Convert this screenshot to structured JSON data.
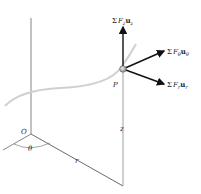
{
  "diagram": {
    "type": "cylindrical-coordinates-force-diagram",
    "point": {
      "label": "P"
    },
    "origin": {
      "label": "O"
    },
    "angle": {
      "label": "θ"
    },
    "radial_distance": {
      "label": "r"
    },
    "height": {
      "label": "z"
    },
    "forces": [
      {
        "sigma": "Σ",
        "F": "F",
        "sub": "z",
        "u": "u",
        "usub": "z"
      },
      {
        "sigma": "Σ",
        "F": "F",
        "sub": "θ",
        "u": "u",
        "usub": "θ"
      },
      {
        "sigma": "Σ",
        "F": "F",
        "sub": "r",
        "u": "u",
        "usub": "r"
      }
    ],
    "colors": {
      "line": "#555555",
      "arrow": "#111111",
      "path": "#cccccc",
      "point": "#9a9a9a"
    }
  }
}
